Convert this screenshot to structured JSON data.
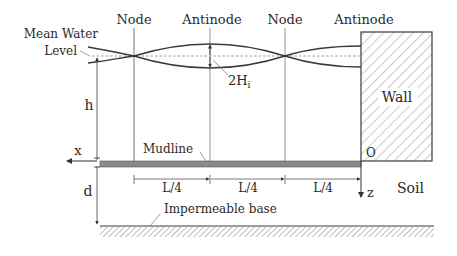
{
  "diagram": {
    "labels": {
      "node_1": "Node",
      "antinode_1": "Antinode",
      "node_2": "Node",
      "antinode_2": "Antinode",
      "mean_water_level_line1": "Mean Water",
      "mean_water_level_line2": "Level",
      "wave_height": "2H",
      "wave_height_sub": "i",
      "water_depth": "h",
      "wall": "Wall",
      "mudline": "Mudline",
      "x_axis": "x",
      "origin": "O",
      "z_axis": "z",
      "soil": "Soil",
      "soil_depth": "d",
      "impermeable_base": "Impermeable base",
      "dim_1": "L/4",
      "dim_2": "L/4",
      "dim_3": "L/4"
    },
    "colors": {
      "line": "#3a3a3a",
      "thin_line": "#777777",
      "mudline_fill": "#8a8a8a",
      "hatch": "#6a6a6a",
      "background": "#ffffff"
    }
  }
}
